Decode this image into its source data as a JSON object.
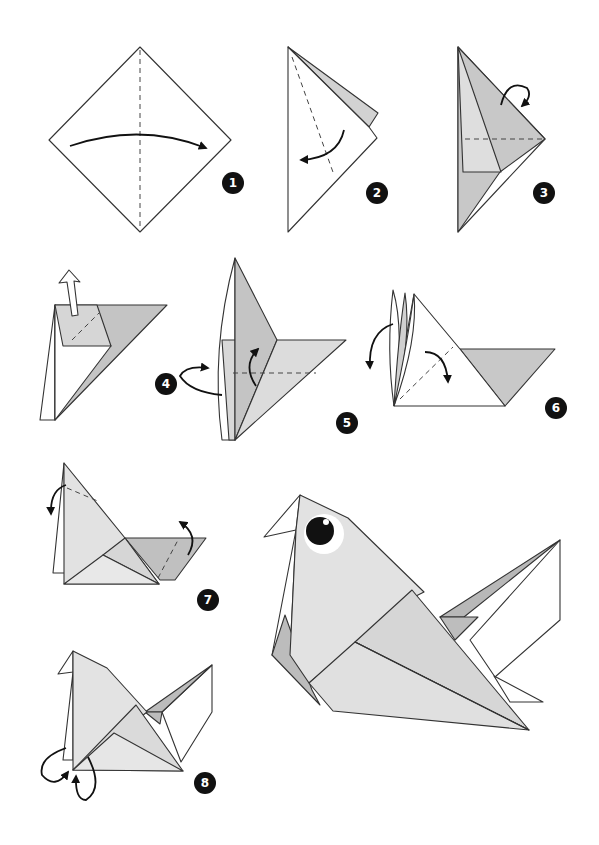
{
  "diagram": {
    "colors": {
      "paper_white": "#ffffff",
      "paper_light": "#e6e6e6",
      "paper_mid": "#cfcfcf",
      "paper_dark": "#b5b5b5",
      "line": "#333333",
      "badge": "#111111"
    },
    "steps": [
      {
        "number": "1",
        "description": "Square on point, valley fold in half left to right"
      },
      {
        "number": "2",
        "description": "Fold front flap to the left along dashed line"
      },
      {
        "number": "3",
        "description": "Fold top flap behind along horizontal dashed line"
      },
      {
        "number": "4",
        "description": "Pull out inner layer upward; turn over"
      },
      {
        "number": "5",
        "description": "Fold flap up along dashed line"
      },
      {
        "number": "6",
        "description": "Fold layers down on both sides"
      },
      {
        "number": "7",
        "description": "Fold head tip back and tail flap up"
      },
      {
        "number": "8",
        "description": "Inside-reverse fold the bottom corners"
      }
    ],
    "final": {
      "description": "Finished origami bird"
    }
  }
}
